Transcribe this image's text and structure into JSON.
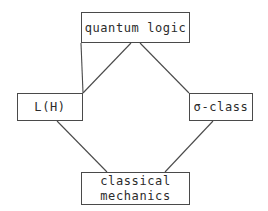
{
  "diagram": {
    "background_color": "#ffffff",
    "line_color": "#4a4a4a",
    "text_color": "#2b2b2b",
    "nodes": [
      {
        "id": "quantum-logic",
        "label": "quantum logic",
        "position": "top"
      },
      {
        "id": "lh",
        "label": "L(H)",
        "position": "left"
      },
      {
        "id": "sigma-class",
        "label": "σ-class",
        "position": "right"
      },
      {
        "id": "classical-mechanics",
        "label": "classical\nmechanics",
        "position": "bottom"
      }
    ],
    "edges": [
      {
        "from": "quantum-logic",
        "to": "lh"
      },
      {
        "from": "quantum-logic",
        "to": "sigma-class"
      },
      {
        "from": "lh",
        "to": "classical-mechanics"
      },
      {
        "from": "sigma-class",
        "to": "classical-mechanics"
      }
    ]
  }
}
